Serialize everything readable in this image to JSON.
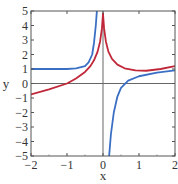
{
  "chart_data": {
    "type": "line",
    "title": "",
    "xlabel": "x",
    "ylabel": "y",
    "xlim": [
      -2,
      2
    ],
    "ylim": [
      -5,
      5
    ],
    "xticks": [
      -2,
      -1,
      0,
      1,
      2
    ],
    "yticks": [
      -5,
      -4,
      -3,
      -2,
      -1,
      0,
      1,
      2,
      3,
      4,
      5
    ],
    "xtick_labels": [
      "−2",
      "−1",
      "0",
      "1",
      "2"
    ],
    "ytick_labels": [
      "−5",
      "−4",
      "−3",
      "−2",
      "−1",
      "0",
      "1",
      "2",
      "3",
      "4",
      "5"
    ],
    "grid": false,
    "legend": null,
    "series": [
      {
        "name": "blue-curve",
        "color": "#3b6fc4",
        "branches": [
          {
            "x": [
              -2,
              -1.5,
              -1,
              -0.75,
              -0.5,
              -0.4,
              -0.3,
              -0.25,
              -0.2,
              -0.17
            ],
            "y": [
              1.0,
              1.0,
              1.0,
              1.05,
              1.2,
              1.45,
              2.0,
              2.8,
              4.0,
              5.0
            ]
          },
          {
            "x": [
              0.17,
              0.22,
              0.3,
              0.4,
              0.5,
              0.7,
              1.0,
              1.5,
              2.0
            ],
            "y": [
              -5.0,
              -3.5,
              -2.0,
              -0.9,
              -0.3,
              0.2,
              0.5,
              0.75,
              0.9
            ]
          }
        ]
      },
      {
        "name": "red-curve",
        "color": "#c0283a",
        "branches": [
          {
            "x": [
              -2,
              -1.5,
              -1,
              -0.75,
              -0.5,
              -0.35,
              -0.25,
              -0.15,
              -0.08,
              -0.03,
              0
            ],
            "y": [
              -0.75,
              -0.4,
              0.0,
              0.35,
              0.8,
              1.2,
              1.6,
              2.2,
              2.9,
              3.8,
              4.8
            ]
          },
          {
            "x": [
              0,
              0.03,
              0.08,
              0.15,
              0.25,
              0.4,
              0.6,
              0.9,
              1.2,
              1.6,
              2.0
            ],
            "y": [
              4.8,
              3.8,
              2.9,
              2.2,
              1.7,
              1.3,
              1.05,
              0.9,
              0.88,
              1.0,
              1.2
            ]
          }
        ]
      }
    ]
  },
  "colors": {
    "frame": "#555555",
    "axis_zero": "#666666",
    "blue": "#3b6fc4",
    "red": "#c0283a"
  }
}
